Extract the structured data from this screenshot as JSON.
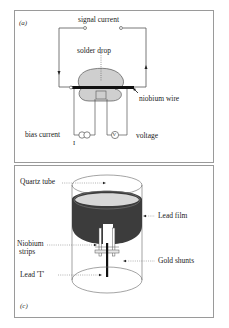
{
  "panels": [
    {
      "id": "a",
      "label": "(a)",
      "annotations": {
        "signal_current": "signal current",
        "solder_drop": "solder drop",
        "niobium_wire": "niobium wire",
        "bias_current": "bias current",
        "current_symbol": "I",
        "voltage": "voltage",
        "voltmeter_symbol": "V"
      }
    },
    {
      "id": "c",
      "label": "(c)",
      "annotations": {
        "quartz_tube": "Quartz tube",
        "lead_film": "Lead film",
        "niobium_strips_line1": "Niobium",
        "niobium_strips_line2": "strips",
        "gold_shunts": "Gold shunts",
        "lead_t": "Lead 'T'"
      }
    }
  ],
  "colors": {
    "line": "#555555",
    "wire": "#111111",
    "solder": "#cfcfcf",
    "lead_film": "#3c3c3c",
    "border": "#9a9a9a"
  }
}
